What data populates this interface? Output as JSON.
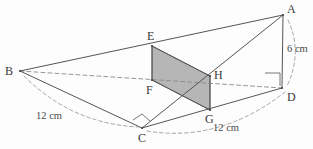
{
  "figure": {
    "background_color": "#fdfdfd",
    "stroke_color": "#555555",
    "dashed_color": "#8a8a8a",
    "shaded_fill_color": "#a9a9a9",
    "shaded_fill_opacity": "0.85"
  },
  "vertices": [
    {
      "id": "A",
      "label": "A",
      "x": 283,
      "y": 15,
      "label_x": 287,
      "label_y": 3,
      "type": "solid"
    },
    {
      "id": "B",
      "label": "B",
      "x": 20,
      "y": 71,
      "label_x": 5,
      "label_y": 65,
      "type": "solid"
    },
    {
      "id": "C",
      "label": "C",
      "x": 142,
      "y": 128,
      "label_x": 138,
      "label_y": 132,
      "type": "solid"
    },
    {
      "id": "D",
      "label": "D",
      "x": 282,
      "y": 88,
      "label_x": 287,
      "label_y": 91,
      "type": "solid"
    },
    {
      "id": "E",
      "label": "E",
      "x": 152,
      "y": 46,
      "label_x": 147,
      "label_y": 30,
      "type": "solid"
    },
    {
      "id": "F",
      "label": "F",
      "x": 152,
      "y": 80,
      "label_x": 146,
      "label_y": 84,
      "type": "solid"
    },
    {
      "id": "G",
      "label": "G",
      "x": 210,
      "y": 110,
      "label_x": 205,
      "label_y": 113,
      "type": "solid"
    },
    {
      "id": "H",
      "label": "H",
      "x": 210,
      "y": 76,
      "label_x": 214,
      "label_y": 69,
      "type": "solid"
    }
  ],
  "edges": [
    {
      "name": "edge-B-A",
      "from": "B",
      "to": "A",
      "style": "solid"
    },
    {
      "name": "edge-B-C",
      "from": "B",
      "to": "C",
      "style": "solid"
    },
    {
      "name": "edge-B-D",
      "from": "B",
      "to": "D",
      "style": "dashed"
    },
    {
      "name": "edge-C-D",
      "from": "C",
      "to": "D",
      "style": "solid"
    },
    {
      "name": "edge-C-A",
      "from": "C",
      "to": "A",
      "style": "solid"
    },
    {
      "name": "edge-A-D",
      "from": "A",
      "to": "D",
      "style": "solid"
    },
    {
      "name": "edge-E-F",
      "from": "E",
      "to": "F",
      "style": "solid"
    },
    {
      "name": "edge-E-H",
      "from": "E",
      "to": "H",
      "style": "solid"
    },
    {
      "name": "edge-F-G",
      "from": "F",
      "to": "G",
      "style": "solid"
    },
    {
      "name": "edge-G-H",
      "from": "G",
      "to": "H",
      "style": "solid"
    }
  ],
  "shaded_face": {
    "name": "cross-section-EFGH",
    "points": "152,46 210,76 210,110 152,80",
    "vertex_order": [
      "E",
      "H",
      "G",
      "F"
    ]
  },
  "dimensions": [
    {
      "id": "dim-6cm",
      "text": "6 cm",
      "label_x": 287,
      "label_y": 44,
      "measures": "A-D",
      "arc": "M 288,20 Q 303,52 287,86"
    },
    {
      "id": "dim-12cm-left",
      "text": "12 cm",
      "label_x": 36,
      "label_y": 111,
      "measures": "B-C",
      "arc": "M 24,76 Q 72,124 139,127"
    },
    {
      "id": "dim-12cm-right",
      "text": "12 cm",
      "label_x": 213,
      "label_y": 123,
      "measures": "C-D",
      "arc": "M 147,131 Q 220,143 285,92"
    }
  ],
  "right_angles": [
    {
      "id": "right-angle-at-D",
      "name": "right-angle-marker-D",
      "points": "265,73 280,73 280,86"
    },
    {
      "id": "right-angle-at-C",
      "name": "right-angle-marker-C",
      "points": "133,120 142,114 150,121"
    }
  ]
}
